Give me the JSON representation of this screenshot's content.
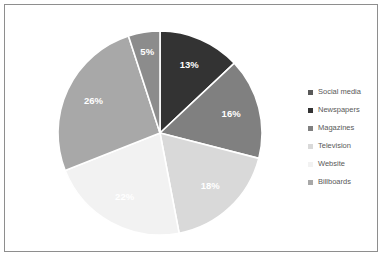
{
  "frame": {
    "border_color": "#8e8e8e",
    "background": "#ffffff"
  },
  "legend": {
    "position": "right",
    "items": [
      {
        "label": "Social media",
        "color": "#595959",
        "marker": "square-marker"
      },
      {
        "label": "Newspapers",
        "color": "#333333",
        "marker": "square-marker"
      },
      {
        "label": "Magazines",
        "color": "#808080",
        "marker": "square-marker"
      },
      {
        "label": "Television",
        "color": "#d9d9d9",
        "marker": "square-marker"
      },
      {
        "label": "Website",
        "color": "#f2f2f2",
        "marker": "square-marker"
      },
      {
        "label": "Billboards",
        "color": "#a8a8a8",
        "marker": "square-marker"
      }
    ]
  },
  "chart_data": {
    "type": "pie",
    "title": "",
    "subtitle": "",
    "xlabel": "",
    "ylabel": "",
    "grid": false,
    "legend_position": "right",
    "start_angle_deg": 0,
    "direction": "clockwise",
    "label_format": "percent",
    "categories": [
      "Social media",
      "Newspapers",
      "Magazines",
      "Television",
      "Website",
      "Billboards"
    ],
    "values": [
      13,
      16,
      18,
      22,
      26,
      5
    ],
    "colors": [
      "#333333",
      "#808080",
      "#d9d9d9",
      "#f2f2f2",
      "#a8a8a8",
      "#8c8c8c"
    ],
    "slices": [
      {
        "label": "Social media",
        "value": 13,
        "display": "13%",
        "color": "#333333"
      },
      {
        "label": "Newspapers",
        "value": 16,
        "display": "16%",
        "color": "#808080"
      },
      {
        "label": "Magazines",
        "value": 18,
        "display": "18%",
        "color": "#d9d9d9"
      },
      {
        "label": "Television",
        "value": 22,
        "display": "22%",
        "color": "#f2f2f2"
      },
      {
        "label": "Website",
        "value": 26,
        "display": "26%",
        "color": "#a8a8a8"
      },
      {
        "label": "Billboards",
        "value": 5,
        "display": "5%",
        "color": "#8c8c8c"
      }
    ]
  }
}
